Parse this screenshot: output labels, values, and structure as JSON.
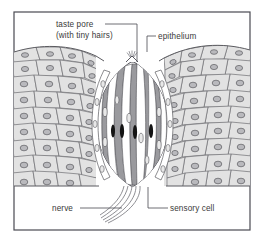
{
  "figure": {
    "name": "taste-bud-cross-section-diagram",
    "background_color": "#ffffff",
    "frame_color": "#4a4a52"
  },
  "labels": [
    {
      "id": "taste-pore",
      "line1": "taste pore",
      "line2": "(with tiny hairs)",
      "text_x": 56,
      "text_y": 27,
      "leader": "M 105 24 L 137 24 L 137 62"
    },
    {
      "id": "epithelium",
      "line1": "epithelium",
      "line2": "",
      "text_x": 158,
      "text_y": 39,
      "leader": "M 156 36 L 147 36 L 147 52"
    },
    {
      "id": "nerve",
      "line1": "nerve",
      "line2": "",
      "text_x": 57,
      "text_y": 211,
      "leader": "M 80 208 L 122 208"
    },
    {
      "id": "sensory-cell",
      "line1": "sensory cell",
      "line2": "",
      "text_x": 170,
      "text_y": 211,
      "leader": "M 168 208 L 148 208 L 148 187"
    }
  ],
  "colors": {
    "epithelium_cell_fill": "#e2e2e2",
    "epithelium_cell_stroke": "#6e6e72",
    "nucleus_fill": "#b9b9bd",
    "nucleus_stroke": "#5b5b60",
    "sensory_cell_fill": "#9a9a9e",
    "support_cell_fill": "#ffffff",
    "dark_nucleus_fill": "#141414",
    "nerve_stroke": "#7a7a80",
    "label_text": "#3a3a3a",
    "frame": "#4a4a52"
  },
  "structures": {
    "taste_bud": "onion-shaped bud of alternating white supporting cells and gray sensory cells",
    "sensory_cell_count": 4,
    "dark_nuclei_count": 4,
    "nerve_fiber_count": 5,
    "taste_pore_location": "apex of bud at epithelial surface"
  }
}
